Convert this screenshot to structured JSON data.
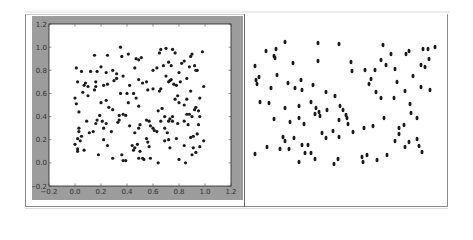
{
  "chart_data": [
    {
      "type": "scatter",
      "title": "",
      "xlabel": "",
      "ylabel": "",
      "xlim": [
        -0.2,
        1.2
      ],
      "ylim": [
        -0.2,
        1.2
      ],
      "grid": false,
      "legend": null,
      "x_ticks": [
        "-0.2",
        "0.0",
        "0.2",
        "0.4",
        "0.6",
        "0.8",
        "1.0",
        "1.2"
      ],
      "y_ticks": [
        "-0.2",
        "0.0",
        "0.2",
        "0.4",
        "0.6",
        "0.8",
        "1.0",
        "1.2"
      ],
      "marker_color": "#1a1a1a",
      "background": "#9c9c9c",
      "points": [
        [
          0.35,
          1.0
        ],
        [
          0.15,
          0.93
        ],
        [
          0.25,
          0.93
        ],
        [
          0.36,
          0.92
        ],
        [
          0.41,
          0.94
        ],
        [
          0.47,
          0.9
        ],
        [
          0.49,
          0.89
        ],
        [
          0.51,
          0.91
        ],
        [
          0.66,
          0.98
        ],
        [
          0.7,
          0.99
        ],
        [
          0.75,
          0.98
        ],
        [
          0.65,
          0.95
        ],
        [
          0.77,
          0.95
        ],
        [
          0.9,
          0.94
        ],
        [
          0.98,
          0.96
        ],
        [
          0.89,
          0.92
        ],
        [
          0.01,
          0.82
        ],
        [
          0.05,
          0.79
        ],
        [
          0.12,
          0.79
        ],
        [
          0.17,
          0.79
        ],
        [
          0.2,
          0.83
        ],
        [
          0.24,
          0.78
        ],
        [
          0.29,
          0.8
        ],
        [
          0.32,
          0.77
        ],
        [
          0.32,
          0.73
        ],
        [
          0.37,
          0.75
        ],
        [
          0.46,
          0.82
        ],
        [
          0.6,
          0.8
        ],
        [
          0.63,
          0.82
        ],
        [
          0.68,
          0.84
        ],
        [
          0.72,
          0.87
        ],
        [
          0.74,
          0.84
        ],
        [
          0.8,
          0.78
        ],
        [
          0.82,
          0.86
        ],
        [
          0.84,
          0.88
        ],
        [
          0.88,
          0.83
        ],
        [
          0.92,
          0.84
        ],
        [
          0.93,
          0.8
        ],
        [
          0.94,
          0.8
        ],
        [
          0.02,
          0.7
        ],
        [
          0.07,
          0.67
        ],
        [
          0.08,
          0.69
        ],
        [
          0.1,
          0.66
        ],
        [
          0.16,
          0.7
        ],
        [
          0.16,
          0.66
        ],
        [
          0.22,
          0.67
        ],
        [
          0.25,
          0.68
        ],
        [
          0.3,
          0.71
        ],
        [
          0.35,
          0.6
        ],
        [
          0.4,
          0.6
        ],
        [
          0.42,
          0.67
        ],
        [
          0.45,
          0.6
        ],
        [
          0.49,
          0.72
        ],
        [
          0.52,
          0.69
        ],
        [
          0.55,
          0.7
        ],
        [
          0.56,
          0.63
        ],
        [
          0.6,
          0.64
        ],
        [
          0.65,
          0.62
        ],
        [
          0.66,
          0.64
        ],
        [
          0.7,
          0.75
        ],
        [
          0.72,
          0.7
        ],
        [
          0.73,
          0.71
        ],
        [
          0.74,
          0.72
        ],
        [
          0.76,
          0.68
        ],
        [
          0.78,
          0.67
        ],
        [
          0.81,
          0.7
        ],
        [
          0.86,
          0.73
        ],
        [
          0.89,
          0.62
        ],
        [
          0.99,
          0.66
        ],
        [
          0.0,
          0.56
        ],
        [
          0.01,
          0.51
        ],
        [
          0.03,
          0.44
        ],
        [
          0.06,
          0.61
        ],
        [
          0.1,
          0.58
        ],
        [
          0.15,
          0.63
        ],
        [
          0.2,
          0.52
        ],
        [
          0.24,
          0.54
        ],
        [
          0.26,
          0.48
        ],
        [
          0.29,
          0.46
        ],
        [
          0.34,
          0.41
        ],
        [
          0.37,
          0.42
        ],
        [
          0.39,
          0.41
        ],
        [
          0.41,
          0.52
        ],
        [
          0.47,
          0.56
        ],
        [
          0.49,
          0.49
        ],
        [
          0.55,
          0.37
        ],
        [
          0.57,
          0.36
        ],
        [
          0.64,
          0.45
        ],
        [
          0.67,
          0.47
        ],
        [
          0.69,
          0.4
        ],
        [
          0.72,
          0.36
        ],
        [
          0.75,
          0.4
        ],
        [
          0.77,
          0.55
        ],
        [
          0.79,
          0.58
        ],
        [
          0.8,
          0.52
        ],
        [
          0.84,
          0.5
        ],
        [
          0.86,
          0.42
        ],
        [
          0.86,
          0.55
        ],
        [
          0.88,
          0.42
        ],
        [
          0.9,
          0.4
        ],
        [
          0.92,
          0.46
        ],
        [
          0.93,
          0.48
        ],
        [
          0.95,
          0.45
        ],
        [
          0.96,
          0.4
        ],
        [
          0.96,
          0.56
        ],
        [
          0.03,
          0.3
        ],
        [
          0.03,
          0.27
        ],
        [
          0.02,
          0.21
        ],
        [
          0.04,
          0.19
        ],
        [
          0.05,
          0.23
        ],
        [
          0.09,
          0.36
        ],
        [
          0.11,
          0.26
        ],
        [
          0.14,
          0.27
        ],
        [
          0.16,
          0.34
        ],
        [
          0.17,
          0.37
        ],
        [
          0.19,
          0.41
        ],
        [
          0.21,
          0.36
        ],
        [
          0.22,
          0.3
        ],
        [
          0.24,
          0.34
        ],
        [
          0.28,
          0.27
        ],
        [
          0.33,
          0.35
        ],
        [
          0.34,
          0.37
        ],
        [
          0.42,
          0.32
        ],
        [
          0.46,
          0.26
        ],
        [
          0.49,
          0.3
        ],
        [
          0.5,
          0.33
        ],
        [
          0.58,
          0.32
        ],
        [
          0.6,
          0.3
        ],
        [
          0.61,
          0.28
        ],
        [
          0.63,
          0.27
        ],
        [
          0.66,
          0.36
        ],
        [
          0.69,
          0.3
        ],
        [
          0.71,
          0.26
        ],
        [
          0.73,
          0.38
        ],
        [
          0.75,
          0.36
        ],
        [
          0.79,
          0.34
        ],
        [
          0.84,
          0.36
        ],
        [
          0.87,
          0.33
        ],
        [
          0.89,
          0.22
        ],
        [
          0.91,
          0.23
        ],
        [
          0.94,
          0.25
        ],
        [
          0.95,
          0.33
        ],
        [
          0.0,
          0.16
        ],
        [
          0.02,
          0.12
        ],
        [
          0.02,
          0.1
        ],
        [
          0.07,
          0.11
        ],
        [
          0.18,
          0.07
        ],
        [
          0.22,
          0.2
        ],
        [
          0.25,
          0.15
        ],
        [
          0.29,
          0.04
        ],
        [
          0.36,
          0.07
        ],
        [
          0.37,
          0.02
        ],
        [
          0.39,
          0.02
        ],
        [
          0.44,
          0.15
        ],
        [
          0.45,
          0.11
        ],
        [
          0.46,
          0.13
        ],
        [
          0.48,
          0.16
        ],
        [
          0.49,
          0.04
        ],
        [
          0.5,
          0.1
        ],
        [
          0.52,
          0.04
        ],
        [
          0.53,
          0.03
        ],
        [
          0.55,
          0.21
        ],
        [
          0.56,
          0.18
        ],
        [
          0.57,
          0.14
        ],
        [
          0.58,
          0.04
        ],
        [
          0.64,
          0.0
        ],
        [
          0.69,
          0.19
        ],
        [
          0.72,
          0.2
        ],
        [
          0.73,
          0.13
        ],
        [
          0.78,
          0.21
        ],
        [
          0.8,
          0.03
        ],
        [
          0.84,
          0.15
        ],
        [
          0.85,
          0.0
        ],
        [
          0.9,
          0.07
        ],
        [
          0.91,
          0.13
        ],
        [
          0.93,
          0.09
        ],
        [
          0.96,
          0.14
        ],
        [
          0.99,
          0.19
        ]
      ]
    },
    {
      "type": "scatter",
      "title": "",
      "xlabel": "",
      "ylabel": "",
      "axes": false,
      "marker_color": "#1a1a1a",
      "marker_shape": "oval",
      "coordinate_space": "panel-pixels",
      "panel_size": [
        202,
        192
      ],
      "points": [
        [
          21,
          37
        ],
        [
          31,
          35
        ],
        [
          40,
          28
        ],
        [
          29,
          42
        ],
        [
          30,
          44
        ],
        [
          73,
          29
        ],
        [
          94,
          30
        ],
        [
          138,
          31
        ],
        [
          164,
          37
        ],
        [
          161,
          40
        ],
        [
          146,
          40
        ],
        [
          178,
          35
        ],
        [
          183,
          35
        ],
        [
          190,
          33
        ],
        [
          184,
          45
        ],
        [
          176,
          51
        ],
        [
          180,
          53
        ],
        [
          48,
          49
        ],
        [
          73,
          47
        ],
        [
          106,
          48
        ],
        [
          136,
          46
        ],
        [
          107,
          57
        ],
        [
          120,
          56
        ],
        [
          130,
          56
        ],
        [
          141,
          51
        ],
        [
          150,
          55
        ],
        [
          10,
          52
        ],
        [
          14,
          63
        ],
        [
          11,
          66
        ],
        [
          12,
          70
        ],
        [
          32,
          61
        ],
        [
          43,
          69
        ],
        [
          56,
          66
        ],
        [
          126,
          65
        ],
        [
          124,
          70
        ],
        [
          152,
          68
        ],
        [
          168,
          62
        ],
        [
          15,
          88
        ],
        [
          24,
          89
        ],
        [
          26,
          74
        ],
        [
          50,
          74
        ],
        [
          57,
          76
        ],
        [
          40,
          94
        ],
        [
          54,
          92
        ],
        [
          68,
          71
        ],
        [
          81,
          78
        ],
        [
          90,
          82
        ],
        [
          131,
          78
        ],
        [
          136,
          84
        ],
        [
          149,
          84
        ],
        [
          160,
          77
        ],
        [
          176,
          73
        ],
        [
          185,
          76
        ],
        [
          29,
          105
        ],
        [
          45,
          108
        ],
        [
          54,
          104
        ],
        [
          59,
          110
        ],
        [
          66,
          88
        ],
        [
          71,
          94
        ],
        [
          70,
          100
        ],
        [
          74,
          98
        ],
        [
          75,
          102
        ],
        [
          82,
          96
        ],
        [
          95,
          92
        ],
        [
          98,
          96
        ],
        [
          101,
          101
        ],
        [
          102,
          104
        ],
        [
          103,
          110
        ],
        [
          94,
          106
        ],
        [
          139,
          104
        ],
        [
          154,
          114
        ],
        [
          159,
          111
        ],
        [
          172,
          104
        ],
        [
          165,
          90
        ],
        [
          166,
          99
        ],
        [
          38,
          123
        ],
        [
          40,
          127
        ],
        [
          49,
          124
        ],
        [
          44,
          135
        ],
        [
          63,
          131
        ],
        [
          77,
          119
        ],
        [
          81,
          124
        ],
        [
          88,
          117
        ],
        [
          94,
          123
        ],
        [
          108,
          118
        ],
        [
          119,
          114
        ],
        [
          128,
          112
        ],
        [
          150,
          127
        ],
        [
          154,
          120
        ],
        [
          160,
          133
        ],
        [
          164,
          128
        ],
        [
          172,
          125
        ],
        [
          174,
          132
        ],
        [
          177,
          138
        ],
        [
          10,
          140
        ],
        [
          35,
          135
        ],
        [
          22,
          133
        ],
        [
          57,
          131
        ],
        [
          54,
          148
        ],
        [
          60,
          139
        ],
        [
          66,
          139
        ],
        [
          70,
          145
        ],
        [
          89,
          150
        ],
        [
          93,
          145
        ],
        [
          117,
          143
        ],
        [
          118,
          148
        ],
        [
          122,
          141
        ],
        [
          132,
          146
        ],
        [
          142,
          141
        ]
      ]
    }
  ]
}
